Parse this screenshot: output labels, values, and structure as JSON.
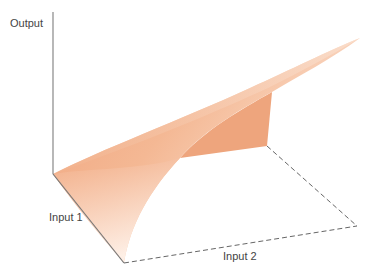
{
  "diagram": {
    "type": "3d-surface-production-function",
    "axes": {
      "vertical_label": "Output",
      "left_label": "Input 1",
      "right_label": "Input 2"
    },
    "colors": {
      "surface_light": "#fbe3d2",
      "surface_mid": "#f3b48d",
      "surface_dark": "#eea27a",
      "axis": "#888888",
      "dashed": "#666666",
      "label": "#444444"
    }
  }
}
